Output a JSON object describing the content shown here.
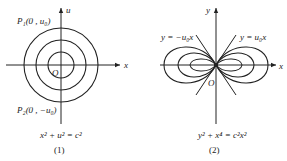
{
  "figures": [
    {
      "id": "1",
      "caption": "(1)",
      "equation": "x² + u² = c²",
      "axes": {
        "horizontal": "x",
        "vertical": "u"
      },
      "origin_label": "O",
      "points": [
        {
          "label": "P₁(0 , u₀)"
        },
        {
          "label": "P₂(0 , −u₀)"
        }
      ],
      "curves": "concentric circles",
      "circle_count": 3
    },
    {
      "id": "2",
      "caption": "(2)",
      "equation": "y² + x⁴ = c²x²",
      "axes": {
        "horizontal": "x",
        "vertical": "y"
      },
      "origin_label": "O",
      "lines": [
        {
          "label": "y = −u₀x"
        },
        {
          "label": "y = u₀x"
        }
      ],
      "curves": "nested figure-eight (lemniscate-like) curves",
      "curve_count": 3
    }
  ]
}
